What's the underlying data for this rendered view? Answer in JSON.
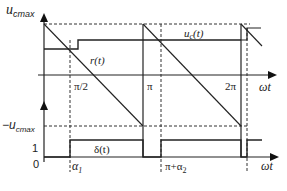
{
  "diagram": {
    "y_axis_label_main": "u",
    "y_axis_label_sub": "cmax",
    "neg_label_prefix": "−u",
    "neg_label_sub": "cmax",
    "level_one_label": "1",
    "origin_label": "0",
    "x_axis_label": "ωt",
    "x_axis_label_lower": "ωt",
    "curve_labels": {
      "reference": "r(t)",
      "control_voltage": "u",
      "control_voltage_sub": "c",
      "control_voltage_suffix": "(t)",
      "duty": "δ(t)"
    },
    "tick_labels": {
      "half_pi": "π/2",
      "pi": "π",
      "two_pi": "2π",
      "alpha1_prefix": "α",
      "alpha1_sub": "1",
      "pi_alpha2_prefix": "π+α",
      "pi_alpha2_sub": "2"
    },
    "colors": {
      "line": "#222222",
      "dashed": "#333333",
      "background": "#ffffff"
    }
  }
}
